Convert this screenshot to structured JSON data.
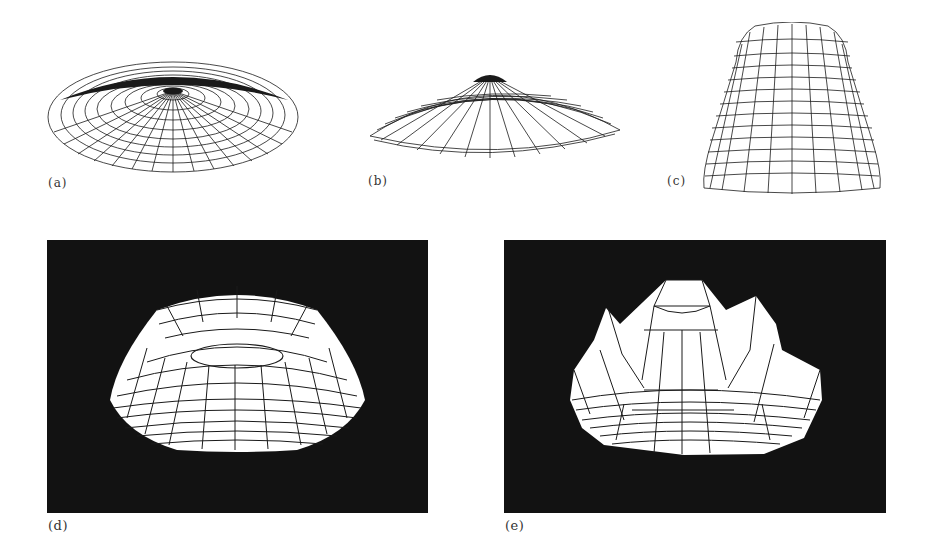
{
  "figure": {
    "panels": [
      {
        "id": "a",
        "label": "(a)",
        "description": "flat dome wireframe, radial meridians and latitude rings",
        "background": "#ffffff"
      },
      {
        "id": "b",
        "label": "(b)",
        "description": "lower, peaked dome wireframe",
        "background": "#ffffff"
      },
      {
        "id": "c",
        "label": "(c)",
        "description": "tall bell-shaped wireframe",
        "background": "#ffffff"
      },
      {
        "id": "d",
        "label": "(d)",
        "description": "torus-like ring solid on dark background",
        "background": "#121212"
      },
      {
        "id": "e",
        "label": "(e)",
        "description": "crown-shaped solid with peaks on dark background",
        "background": "#121212"
      }
    ]
  },
  "colors": {
    "page": "#ffffff",
    "ink": "#1a1a1a",
    "dark_bg": "#121212",
    "mesh_fill": "#ffffff"
  }
}
